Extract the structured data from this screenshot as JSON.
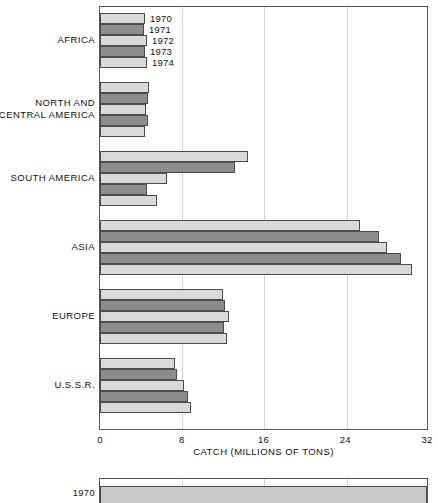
{
  "chart_data": {
    "type": "bar",
    "orientation": "horizontal",
    "title": "",
    "xlabel": "CATCH (MILLIONS OF TONS)",
    "ylabel": "",
    "xlim": [
      0,
      32
    ],
    "xticks": [
      0,
      8,
      16,
      24,
      32
    ],
    "xtick_labels": [
      "0",
      "8",
      "16",
      "24",
      "32"
    ],
    "grid": true,
    "grid_axis": "x",
    "legend": "inline year labels on first group",
    "series_names": [
      "1970",
      "1971",
      "1972",
      "1973",
      "1974"
    ],
    "categories": [
      "AFRICA",
      "NORTH AND\nCENTRAL AMERICA",
      "SOUTH AMERICA",
      "ASIA",
      "EUROPE",
      "U.S.S.R."
    ],
    "series": [
      {
        "name": "1970",
        "values": [
          4.4,
          4.8,
          14.5,
          25.4,
          12.0,
          7.3
        ]
      },
      {
        "name": "1971",
        "values": [
          4.3,
          4.7,
          13.2,
          27.3,
          12.2,
          7.5
        ]
      },
      {
        "name": "1972",
        "values": [
          4.6,
          4.5,
          6.6,
          28.1,
          12.6,
          8.2
        ]
      },
      {
        "name": "1973",
        "values": [
          4.4,
          4.7,
          4.6,
          29.5,
          12.1,
          8.6
        ]
      },
      {
        "name": "1974",
        "values": [
          4.6,
          4.4,
          5.6,
          30.5,
          12.4,
          8.9
        ]
      }
    ],
    "bar_colors": {
      "odd": "#d9d9d9",
      "even": "#8c8c8c",
      "border": "#4d4d4d"
    }
  },
  "axis": {
    "tick_labels": [
      "0",
      "8",
      "16",
      "24",
      "32"
    ],
    "title": "CATCH (MILLIONS OF TONS)"
  },
  "year_labels": [
    "1970",
    "1971",
    "1972",
    "1973",
    "1974"
  ],
  "categories": [
    {
      "label": "AFRICA"
    },
    {
      "label": "NORTH AND\nCENTRAL AMERICA"
    },
    {
      "label": "SOUTH AMERICA"
    },
    {
      "label": "ASIA"
    },
    {
      "label": "EUROPE"
    },
    {
      "label": "U.S.S.R."
    }
  ],
  "second_chart": {
    "type": "bar",
    "orientation": "horizontal",
    "categories": [
      "1970"
    ],
    "values": [
      32
    ],
    "xticks": [
      0,
      8,
      16,
      24,
      32
    ],
    "label": "1970"
  }
}
